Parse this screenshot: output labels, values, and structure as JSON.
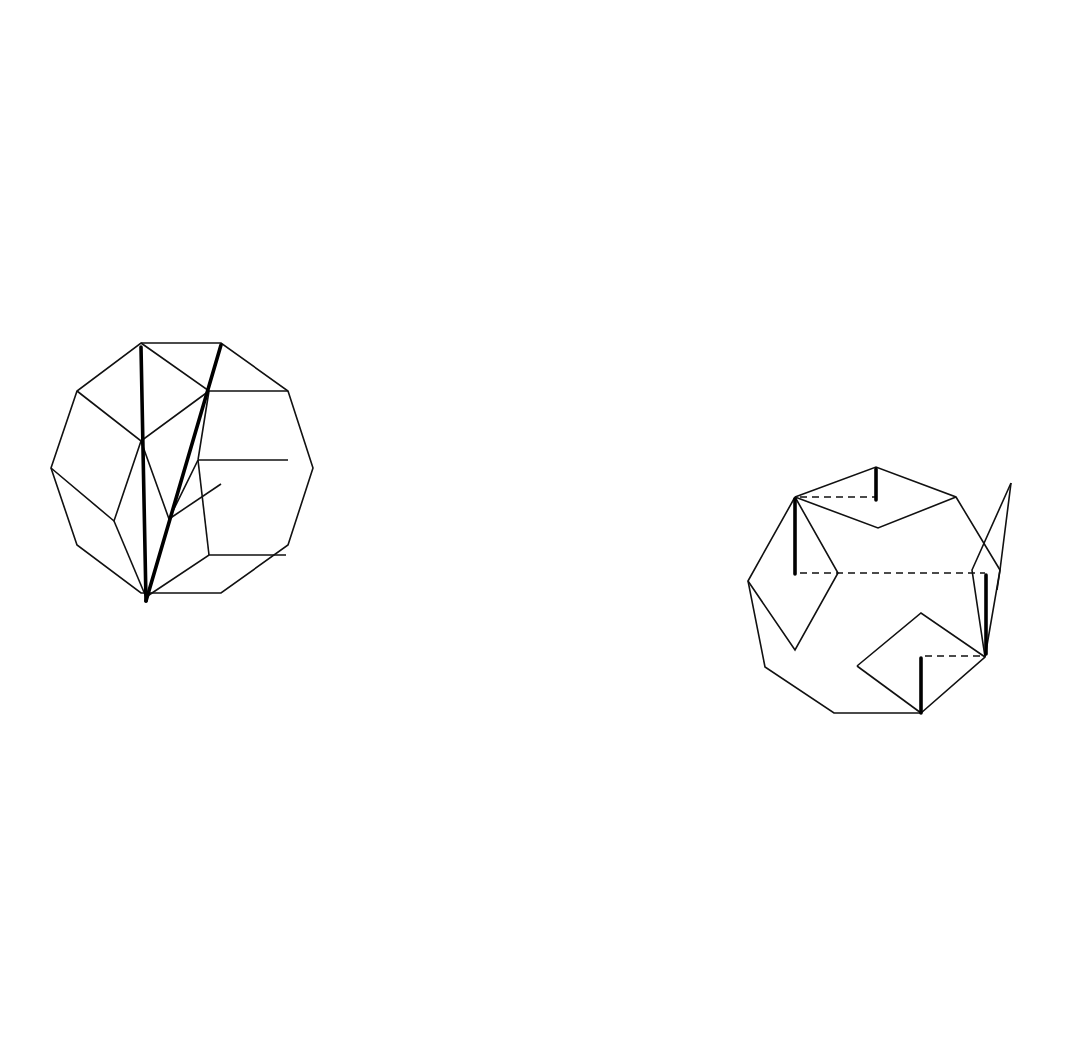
{
  "top_strip": {
    "description": "Rolling regular decagon (even n), successive positions",
    "sides": 10,
    "count": 10,
    "side_length": 83.3,
    "first_center_x": 160,
    "baseline_y": 303,
    "baseline_x": [
      40,
      1042
    ],
    "labels": [
      {
        "text": "a",
        "x": 144,
        "y": 296
      },
      {
        "text": "b",
        "x": 180,
        "y": 244
      },
      {
        "text": "c",
        "x": 254,
        "y": 166
      },
      {
        "text": "d",
        "x": 378,
        "y": 94
      },
      {
        "text": "e",
        "x": 478,
        "y": 73
      },
      {
        "text": "e",
        "x": 553,
        "y": 73
      },
      {
        "text": "d",
        "x": 666,
        "y": 94
      },
      {
        "text": "c",
        "x": 806,
        "y": 166
      },
      {
        "text": "b",
        "x": 878,
        "y": 237
      },
      {
        "text": "a",
        "x": 910,
        "y": 292
      }
    ]
  },
  "even_inset": {
    "caption_prefix": "Even ",
    "caption_var": "n",
    "caption_suffix": "...",
    "labels": [
      {
        "text": "b",
        "x": 120,
        "y": 400
      },
      {
        "text": "a",
        "x": 222,
        "y": 383
      },
      {
        "text": "c",
        "x": 193,
        "y": 483
      },
      {
        "text": "d",
        "x": 117,
        "y": 534
      },
      {
        "text": "e",
        "x": 166,
        "y": 566
      }
    ]
  },
  "odd_inset": {
    "caption_prefix": "Odd ",
    "caption_var": "n",
    "caption_suffix": "...",
    "labels": [
      {
        "text": "a",
        "x": 884,
        "y": 502
      },
      {
        "text": "c",
        "x": 801,
        "y": 561
      },
      {
        "text": "d",
        "x": 997,
        "y": 618
      },
      {
        "text": "b",
        "x": 932,
        "y": 690
      }
    ]
  },
  "bottom_strip": {
    "description": "Rolling regular nonagon (odd n), successive positions",
    "sides": 9,
    "count": 9,
    "side_length": 87.5,
    "first_center_x": 161.5,
    "baseline_y": 1017,
    "baseline_x": [
      52,
      1000
    ],
    "labels": [
      {
        "text": "2a",
        "x": 143,
        "y": 1009
      },
      {
        "text": "2b",
        "x": 186,
        "y": 945
      },
      {
        "text": "2c",
        "x": 279,
        "y": 870
      },
      {
        "text": "2d",
        "x": 431,
        "y": 764
      },
      {
        "text": "2d",
        "x": 585,
        "y": 764
      },
      {
        "text": "2c",
        "x": 743,
        "y": 862
      },
      {
        "text": "2b",
        "x": 845,
        "y": 940
      },
      {
        "text": "2a",
        "x": 888,
        "y": 1002
      }
    ]
  },
  "divider": {
    "x1": 82,
    "y1": 697,
    "x2": 1028,
    "y2": 357
  }
}
